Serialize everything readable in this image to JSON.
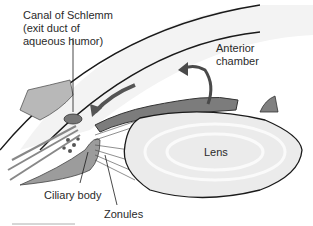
{
  "diagram": {
    "labels": {
      "canal": "Canal of Schlemm (exit duct of aqueous humor)",
      "anterior_chamber": "Anterior chamber",
      "lens": "Lens",
      "ciliary_body": "Ciliary body",
      "zonules": "Zonules"
    },
    "structures": [
      "cornea",
      "sclera",
      "iris",
      "canal-of-schlemm",
      "ciliary-body",
      "zonules",
      "lens",
      "anterior-chamber"
    ],
    "arrows": [
      {
        "name": "aqueous-flow-arrow",
        "description": "curved arrow in anterior chamber"
      },
      {
        "name": "drainage-arrow",
        "description": "arrow pointing toward canal of Schlemm"
      }
    ],
    "colors": {
      "outline": "#1a1a1a",
      "tissue_gray": "#9a9a9a",
      "tissue_dark": "#6e6e6e",
      "lens_fill": "#ececec",
      "cornea_fill": "#f4f4f4"
    }
  }
}
